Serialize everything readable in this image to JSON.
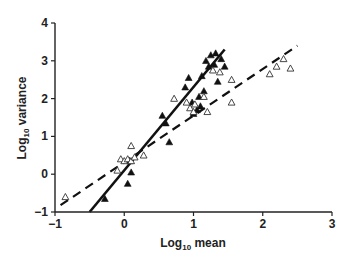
{
  "chart_data": {
    "type": "scatter",
    "title": "",
    "xlabel": "Log10 mean",
    "ylabel": "Log10 variance",
    "xlabel_parts": {
      "base": "Log",
      "sub": "10",
      "rest": " mean"
    },
    "ylabel_parts": {
      "base": "Log",
      "sub": "10",
      "rest": " variance"
    },
    "xlim": [
      -1,
      3
    ],
    "ylim": [
      -1,
      4
    ],
    "xticks": [
      -1,
      0,
      1,
      2,
      3
    ],
    "yticks": [
      -1,
      0,
      1,
      2,
      3,
      4
    ],
    "grid": false,
    "legend": null,
    "series": [
      {
        "name": "filled triangles",
        "marker": "filled-triangle",
        "points": [
          [
            -0.28,
            -0.65
          ],
          [
            0.05,
            -0.25
          ],
          [
            0.1,
            0.05
          ],
          [
            0.08,
            0.35
          ],
          [
            0.55,
            1.55
          ],
          [
            0.6,
            1.35
          ],
          [
            0.65,
            0.85
          ],
          [
            0.88,
            2.3
          ],
          [
            0.93,
            2.55
          ],
          [
            0.98,
            1.9
          ],
          [
            1.0,
            1.6
          ],
          [
            1.05,
            1.7
          ],
          [
            1.08,
            2.05
          ],
          [
            1.1,
            1.8
          ],
          [
            1.12,
            2.6
          ],
          [
            1.15,
            2.2
          ],
          [
            1.18,
            3.0
          ],
          [
            1.22,
            2.85
          ],
          [
            1.25,
            3.15
          ],
          [
            1.3,
            2.9
          ],
          [
            1.32,
            3.2
          ],
          [
            1.35,
            2.45
          ],
          [
            1.4,
            3.05
          ],
          [
            1.45,
            2.85
          ]
        ]
      },
      {
        "name": "open triangles",
        "marker": "open-triangle",
        "points": [
          [
            -0.85,
            -0.6
          ],
          [
            -0.1,
            0.1
          ],
          [
            -0.05,
            0.4
          ],
          [
            0.0,
            0.35
          ],
          [
            0.05,
            0.4
          ],
          [
            0.1,
            0.35
          ],
          [
            0.15,
            0.45
          ],
          [
            0.1,
            0.75
          ],
          [
            0.28,
            0.5
          ],
          [
            0.72,
            2.0
          ],
          [
            0.9,
            1.9
          ],
          [
            0.95,
            1.75
          ],
          [
            1.0,
            1.65
          ],
          [
            1.02,
            1.85
          ],
          [
            1.15,
            2.05
          ],
          [
            1.2,
            1.65
          ],
          [
            1.28,
            2.75
          ],
          [
            1.38,
            2.7
          ],
          [
            1.55,
            2.5
          ],
          [
            1.55,
            1.9
          ],
          [
            2.1,
            2.65
          ],
          [
            2.2,
            2.85
          ],
          [
            2.3,
            3.05
          ],
          [
            2.4,
            2.8
          ]
        ]
      }
    ],
    "fit_lines": [
      {
        "name": "solid regression",
        "style": "solid",
        "from": [
          -0.5,
          -1.0
        ],
        "to": [
          1.45,
          3.3
        ]
      },
      {
        "name": "dashed regression",
        "style": "dashed",
        "from": [
          -0.92,
          -0.82
        ],
        "to": [
          2.5,
          3.4
        ]
      }
    ]
  }
}
